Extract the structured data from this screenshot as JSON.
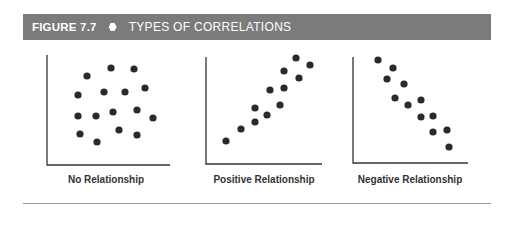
{
  "header": {
    "figure_number": "FIGURE 7.7",
    "bullet_icon": "hexagon-bullet",
    "title": "TYPES OF CORRELATIONS"
  },
  "colors": {
    "header_bg": "#7b7b7b",
    "header_text": "#ffffff",
    "dot": "#2a2a2a",
    "axis": "#333333",
    "rule": "#9a9a9a"
  },
  "chart_data": [
    {
      "type": "scatter",
      "title": "No Relationship",
      "xlabel": "",
      "ylabel": "",
      "grid": false,
      "axes_ticks": false,
      "points": [
        [
          87,
          76
        ],
        [
          111,
          68
        ],
        [
          134,
          69
        ],
        [
          78,
          95
        ],
        [
          104,
          92
        ],
        [
          125,
          92
        ],
        [
          145,
          88
        ],
        [
          78,
          116
        ],
        [
          96,
          116
        ],
        [
          113,
          112
        ],
        [
          137,
          110
        ],
        [
          153,
          118
        ],
        [
          80,
          134
        ],
        [
          97,
          142
        ],
        [
          119,
          130
        ],
        [
          137,
          135
        ]
      ],
      "axis": {
        "x0": 47,
        "y_top": 55,
        "y0": 165,
        "x_end": 170
      }
    },
    {
      "type": "scatter",
      "title": "Positive Relationship",
      "xlabel": "",
      "ylabel": "",
      "grid": false,
      "axes_ticks": false,
      "points": [
        [
          226,
          141
        ],
        [
          241,
          129
        ],
        [
          255,
          122
        ],
        [
          255,
          108
        ],
        [
          267,
          115
        ],
        [
          270,
          90
        ],
        [
          280,
          105
        ],
        [
          284,
          88
        ],
        [
          284,
          71
        ],
        [
          296,
          58
        ],
        [
          299,
          78
        ],
        [
          310,
          65
        ]
      ],
      "axis": {
        "x0": 206,
        "y_top": 57,
        "y0": 164,
        "x_end": 322
      }
    },
    {
      "type": "scatter",
      "title": "Negative Relationship",
      "xlabel": "",
      "ylabel": "",
      "grid": false,
      "axes_ticks": false,
      "points": [
        [
          378,
          60
        ],
        [
          393,
          68
        ],
        [
          387,
          79
        ],
        [
          404,
          84
        ],
        [
          395,
          98
        ],
        [
          408,
          105
        ],
        [
          421,
          100
        ],
        [
          421,
          117
        ],
        [
          433,
          116
        ],
        [
          433,
          132
        ],
        [
          447,
          130
        ],
        [
          449,
          147
        ]
      ],
      "axis": {
        "x0": 353,
        "y_top": 57,
        "y0": 163,
        "x_end": 468
      }
    }
  ],
  "labels": [
    "No Relationship",
    "Positive Relationship",
    "Negative Relationship"
  ]
}
